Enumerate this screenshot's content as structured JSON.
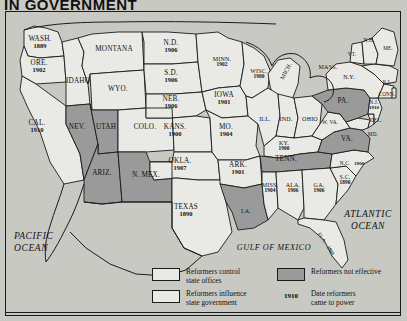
{
  "title": "IN GOVERNMENT",
  "colors": {
    "page_bg": "#c9c9c4",
    "state_open": "#e9e9e5",
    "state_gray": "#9a9a9a",
    "outline": "#1a1a1a"
  },
  "oceans": {
    "pacific_line1": "PACIFIC",
    "pacific_line2": "OCEAN",
    "atlantic_line1": "ATLANTIC",
    "atlantic_line2": "OCEAN",
    "gulf": "GULF OF MEXICO"
  },
  "legend": {
    "items": [
      {
        "swatch": "open",
        "label_line1": "Reformers control",
        "label_line2": "state offices"
      },
      {
        "swatch": "open",
        "label_line1": "Reformers influence",
        "label_line2": "state government"
      },
      {
        "swatch": "gray",
        "label_line1": "Reformers not effective",
        "label_line2": ""
      },
      {
        "swatch": "date",
        "date": "1910",
        "label_line1": "Date reformers",
        "label_line2": "came to power"
      }
    ]
  },
  "states": [
    {
      "id": "WA",
      "name": "WASH.",
      "date": "1889",
      "fill": "open"
    },
    {
      "id": "OR",
      "name": "ORE.",
      "date": "1902",
      "fill": "open"
    },
    {
      "id": "CA",
      "name": "CAL.",
      "date": "1910",
      "fill": "open"
    },
    {
      "id": "ID",
      "name": "IDAHO",
      "date": "",
      "fill": "open"
    },
    {
      "id": "NV",
      "name": "NEV.",
      "date": "",
      "fill": "gray"
    },
    {
      "id": "UT",
      "name": "UTAH",
      "date": "",
      "fill": "gray"
    },
    {
      "id": "AZ",
      "name": "ARIZ.",
      "date": "",
      "fill": "gray"
    },
    {
      "id": "NM",
      "name": "N. MEX.",
      "date": "",
      "fill": "gray"
    },
    {
      "id": "MT",
      "name": "MONTANA",
      "date": "",
      "fill": "open"
    },
    {
      "id": "WY",
      "name": "WYO.",
      "date": "",
      "fill": "open"
    },
    {
      "id": "CO",
      "name": "COLO.",
      "date": "",
      "fill": "open"
    },
    {
      "id": "ND",
      "name": "N.D.",
      "date": "1906",
      "fill": "open"
    },
    {
      "id": "SD",
      "name": "S.D.",
      "date": "1906",
      "fill": "open"
    },
    {
      "id": "NE",
      "name": "NEB.",
      "date": "1906",
      "fill": "open"
    },
    {
      "id": "KS",
      "name": "KANS.",
      "date": "1900",
      "fill": "open"
    },
    {
      "id": "OK",
      "name": "OKLA.",
      "date": "1907",
      "fill": "open"
    },
    {
      "id": "TX",
      "name": "TEXAS",
      "date": "1890",
      "fill": "open"
    },
    {
      "id": "MN",
      "name": "MINN.",
      "date": "1902",
      "fill": "open"
    },
    {
      "id": "IA",
      "name": "IOWA",
      "date": "1901",
      "fill": "open"
    },
    {
      "id": "MO",
      "name": "MO.",
      "date": "1904",
      "fill": "open"
    },
    {
      "id": "AR",
      "name": "ARK.",
      "date": "1901",
      "fill": "open"
    },
    {
      "id": "LA",
      "name": "LA.",
      "date": "",
      "fill": "gray"
    },
    {
      "id": "WI",
      "name": "WISC.",
      "date": "1900",
      "fill": "open"
    },
    {
      "id": "MI",
      "name": "MICH.",
      "date": "",
      "fill": "open"
    },
    {
      "id": "IL",
      "name": "ILL.",
      "date": "",
      "fill": "open"
    },
    {
      "id": "IN",
      "name": "IND.",
      "date": "",
      "fill": "open"
    },
    {
      "id": "OH",
      "name": "OHIO",
      "date": "",
      "fill": "open"
    },
    {
      "id": "KY",
      "name": "KY.",
      "date": "1900",
      "fill": "open"
    },
    {
      "id": "TN",
      "name": "TENN.",
      "date": "",
      "fill": "gray"
    },
    {
      "id": "MS",
      "name": "MISS.",
      "date": "1904",
      "fill": "open"
    },
    {
      "id": "AL",
      "name": "ALA.",
      "date": "1906",
      "fill": "open"
    },
    {
      "id": "GA",
      "name": "GA.",
      "date": "1906",
      "fill": "open"
    },
    {
      "id": "FL",
      "name": "FLA.",
      "date": "1901",
      "fill": "open"
    },
    {
      "id": "SC",
      "name": "S.C.",
      "date": "1890",
      "fill": "open"
    },
    {
      "id": "NC",
      "name": "N.C.",
      "date": "1900",
      "fill": "open"
    },
    {
      "id": "VA",
      "name": "VA.",
      "date": "",
      "fill": "gray"
    },
    {
      "id": "WV",
      "name": "W. VA.",
      "date": "",
      "fill": "open"
    },
    {
      "id": "MD",
      "name": "MD.",
      "date": "",
      "fill": "open"
    },
    {
      "id": "DE",
      "name": "DEL.",
      "date": "",
      "fill": "open"
    },
    {
      "id": "PA",
      "name": "PA.",
      "date": "",
      "fill": "gray"
    },
    {
      "id": "NJ",
      "name": "N.J.",
      "date": "1910",
      "fill": "open"
    },
    {
      "id": "NY",
      "name": "N.Y.",
      "date": "",
      "fill": "open"
    },
    {
      "id": "CT",
      "name": "CONN.",
      "date": "",
      "fill": "open"
    },
    {
      "id": "RI",
      "name": "R.I.",
      "date": "",
      "fill": "open"
    },
    {
      "id": "MA",
      "name": "MASS.",
      "date": "",
      "fill": "open"
    },
    {
      "id": "VT",
      "name": "VT.",
      "date": "",
      "fill": "open"
    },
    {
      "id": "NH",
      "name": "N.H.",
      "date": "",
      "fill": "open"
    },
    {
      "id": "ME",
      "name": "ME.",
      "date": "",
      "fill": "open"
    }
  ]
}
